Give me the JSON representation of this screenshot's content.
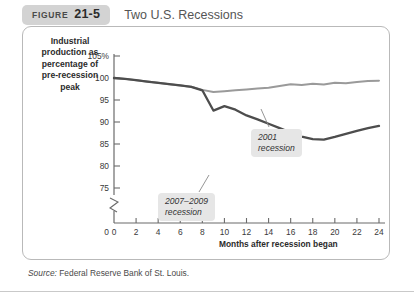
{
  "figure": {
    "badge_word": "Figure",
    "badge_number": "21-5",
    "title": "Two U.S. Recessions"
  },
  "source": {
    "prefix": "Source:",
    "text": "Federal Reserve Bank of St. Louis."
  },
  "colors": {
    "line_2001": "#9a9a9a",
    "line_2007": "#4d4d4d",
    "axis": "#6b6b6b",
    "badge_bg": "#d3d3d3",
    "callout_bg": "#e6e6e6",
    "panel_border": "#b9b9b9"
  },
  "chart_data": {
    "type": "line",
    "title": "Two U.S. Recessions",
    "xlabel": "Months after recession began",
    "ylabel": "Industrial production as percentage of pre-recession peak",
    "ylabel_lines": [
      "Industrial",
      "production as",
      "percentage of",
      "pre-recession",
      "peak"
    ],
    "xlim": [
      0,
      24
    ],
    "ylim": [
      73,
      106
    ],
    "xticks": [
      0,
      2,
      4,
      6,
      8,
      10,
      12,
      14,
      16,
      18,
      20,
      22,
      24
    ],
    "xtick_labels": [
      "0",
      "2",
      "4",
      "6",
      "8",
      "10",
      "12",
      "14",
      "16",
      "18",
      "20",
      "22",
      "24"
    ],
    "yticks": [
      75,
      80,
      85,
      90,
      95,
      100,
      105
    ],
    "ytick_labels": [
      "75",
      "80",
      "85",
      "90",
      "95",
      "100",
      "105%"
    ],
    "y_axis_break": true,
    "y_origin_label": "0",
    "grid": false,
    "legend": "annotations-inline",
    "x": [
      0,
      1,
      2,
      3,
      4,
      5,
      6,
      7,
      8,
      9,
      10,
      11,
      12,
      13,
      14,
      15,
      16,
      17,
      18,
      19,
      20,
      21,
      22,
      23,
      24
    ],
    "series": [
      {
        "name": "2001 recession",
        "color": "#9a9a9a",
        "annotation": "2001\nrecession",
        "annotation_lines": [
          "2001",
          "recession"
        ],
        "values": [
          100.0,
          99.8,
          99.5,
          99.2,
          98.9,
          98.6,
          98.3,
          98.0,
          97.3,
          96.8,
          97.0,
          97.2,
          97.4,
          97.6,
          97.8,
          98.2,
          98.6,
          98.4,
          98.7,
          98.5,
          98.9,
          98.8,
          99.1,
          99.3,
          99.4
        ]
      },
      {
        "name": "2007-2009 recession",
        "color": "#4d4d4d",
        "annotation": "2007–2009\nrecession",
        "annotation_lines": [
          "2007–2009",
          "recession"
        ],
        "values": [
          100.0,
          99.8,
          99.5,
          99.2,
          98.9,
          98.6,
          98.3,
          98.0,
          97.2,
          92.6,
          93.6,
          92.8,
          91.5,
          90.6,
          89.6,
          88.6,
          87.6,
          86.7,
          86.1,
          86.0,
          86.6,
          87.3,
          88.0,
          88.6,
          89.1
        ]
      }
    ]
  }
}
